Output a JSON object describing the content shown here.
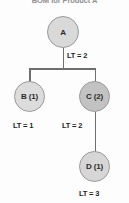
{
  "diagram": {
    "title": "BOM for Product A",
    "type": "bill-of-materials-tree",
    "nodes": [
      {
        "id": "A",
        "label": "A",
        "quantity": null,
        "level": 0,
        "shade": "light"
      },
      {
        "id": "B",
        "label": "B (1)",
        "quantity": 1,
        "level": 1,
        "shade": "light"
      },
      {
        "id": "C",
        "label": "C (2)",
        "quantity": 2,
        "level": 1,
        "shade": "dark"
      },
      {
        "id": "D",
        "label": "D (1)",
        "quantity": 1,
        "level": 2,
        "shade": "light"
      }
    ],
    "lead_times": [
      {
        "for_node": "A",
        "label": "LT = 2",
        "value": 2
      },
      {
        "for_node": "B",
        "label": "LT = 1",
        "value": 1
      },
      {
        "for_node": "C",
        "label": "LT = 2",
        "value": 2
      },
      {
        "for_node": "D",
        "label": "LT = 3",
        "value": 3
      }
    ],
    "edges": [
      {
        "from": "A",
        "to": "B"
      },
      {
        "from": "A",
        "to": "C"
      },
      {
        "from": "C",
        "to": "D"
      }
    ],
    "colors": {
      "background": "#fdfdfd",
      "node_light": "#d9d9d9",
      "node_dark": "#c2c2c2",
      "node_stroke": "#9a9a9a",
      "edge": "#6e6e6e",
      "title_text": "#8f8f8f",
      "label_text": "#1f1f1f"
    }
  }
}
